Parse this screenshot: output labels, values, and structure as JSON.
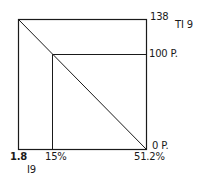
{
  "diagram": {
    "labels": {
      "top_right_value": "138",
      "figure_tag": "TI 9",
      "mid_right_value": "100 P.",
      "bottom_right_value": "0 P.",
      "bottom_left_value": "1.8",
      "bottom_mid_value": "15%",
      "bottom_right_axis_value": "51.2%",
      "bottom_tag": "I9"
    },
    "colors": {
      "line": "#1a1a1a",
      "background": "#ffffff"
    }
  }
}
